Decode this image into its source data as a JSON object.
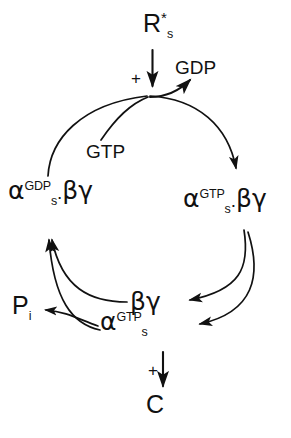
{
  "figure": {
    "type": "cyclic-reaction-diagram",
    "ink_color": "#111111",
    "background_color": "#ffffff"
  },
  "nodes": {
    "receptor": {
      "base": "R",
      "subscript": "s",
      "superscript": "*",
      "full_text": "Rs*"
    },
    "gdp_release": {
      "text": "GDP"
    },
    "gtp_input": {
      "text": "GTP"
    },
    "alpha_gdp_bg": {
      "base": "α",
      "superscript": "GDP",
      "subscript": "s",
      "separator": ".",
      "partner": "βγ",
      "full_text": "αs(GDP).βγ"
    },
    "alpha_gtp_bg": {
      "base": "α",
      "superscript": "GTP",
      "subscript": "s",
      "separator": ".",
      "partner": "βγ",
      "full_text": "αs(GTP).βγ"
    },
    "beta_gamma": {
      "text": "βγ"
    },
    "alpha_gtp": {
      "base": "α",
      "superscript": "GTP",
      "subscript": "s",
      "full_text": "αs(GTP)"
    },
    "phosphate": {
      "base": "P",
      "subscript": "i",
      "full_text": "Pi"
    },
    "catalyst": {
      "text": "C"
    }
  },
  "operators": {
    "plus_top": "+",
    "plus_bottom": "+"
  },
  "arrows": [
    {
      "name": "receptor-input-arrow",
      "from": "Rs*",
      "to": "cycle-top",
      "direction": "down"
    },
    {
      "name": "gdp-release-arrow",
      "from": "cycle-top",
      "to": "GDP",
      "direction": "up-right"
    },
    {
      "name": "gtp-entry-arrow",
      "from": "GTP",
      "to": "cycle-top",
      "direction": "up-right"
    },
    {
      "name": "top-to-right-arc",
      "from": "cycle-top",
      "to": "αs(GTP).βγ",
      "direction": "clockwise"
    },
    {
      "name": "left-arc-up",
      "from": "αs(GDP).βγ",
      "to": "cycle-top",
      "direction": "clockwise"
    },
    {
      "name": "right-arc-to-beta-gamma",
      "from": "αs(GTP).βγ",
      "to": "βγ",
      "direction": "left"
    },
    {
      "name": "right-arc-to-alpha-gtp",
      "from": "αs(GTP).βγ",
      "to": "αs(GTP)",
      "direction": "left"
    },
    {
      "name": "beta-gamma-recycle-arrow",
      "from": "βγ",
      "to": "αs(GDP).βγ",
      "direction": "up-left"
    },
    {
      "name": "alpha-gtp-recycle-arrow",
      "from": "αs(GTP)",
      "to": "αs(GDP).βγ",
      "direction": "up-left"
    },
    {
      "name": "phosphate-release-arrow",
      "from": "αs(GTP)",
      "to": "Pi",
      "direction": "left"
    },
    {
      "name": "catalyst-output-arrow",
      "from": "αs(GTP)",
      "to": "C",
      "direction": "down"
    }
  ]
}
